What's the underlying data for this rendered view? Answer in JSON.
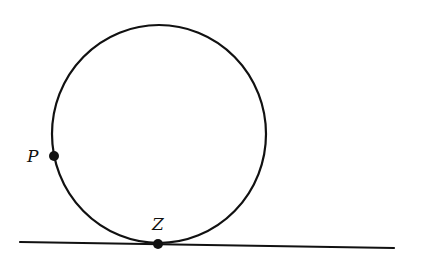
{
  "diagram": {
    "colors": {
      "stroke": "#111111",
      "background": "#ffffff"
    },
    "circle": {
      "cx": 159,
      "cy": 134,
      "rx": 107,
      "ry": 109
    },
    "ground_line": {
      "x1": 20,
      "y1": 242,
      "x2": 394,
      "y2": 248
    },
    "points": [
      {
        "id": "P",
        "label": "P",
        "x": 54,
        "y": 156,
        "label_x": 27,
        "label_y": 162
      },
      {
        "id": "Z",
        "label": "Z",
        "x": 158,
        "y": 244,
        "label_x": 152,
        "label_y": 230
      }
    ]
  }
}
